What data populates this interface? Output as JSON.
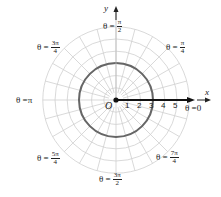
{
  "chart_data": {
    "type": "polar",
    "title": "",
    "axes": {
      "x_label": "x",
      "y_label": "y",
      "origin_label": "O"
    },
    "radial_ticks": [
      "1",
      "2",
      "3",
      "4",
      "5"
    ],
    "radial_max": 6,
    "angular_grid_step_deg": 15,
    "curve": {
      "equation": "r = 3",
      "radius": 3,
      "color": "#666666"
    },
    "ray": {
      "theta": 0,
      "color": "#111111"
    },
    "angle_labels": [
      {
        "id": "theta-0",
        "prefix": "θ = ",
        "value": "0"
      },
      {
        "id": "theta-pi-over-4",
        "prefix": "θ = ",
        "num": "π",
        "den": "4"
      },
      {
        "id": "theta-pi-over-2",
        "prefix": "θ = ",
        "num": "π",
        "den": "2"
      },
      {
        "id": "theta-3pi-over-4",
        "prefix": "θ = ",
        "num": "3π",
        "den": "4"
      },
      {
        "id": "theta-pi",
        "prefix": "θ = ",
        "value": "π"
      },
      {
        "id": "theta-5pi-over-4",
        "prefix": "θ = ",
        "num": "5π",
        "den": "4"
      },
      {
        "id": "theta-3pi-over-2",
        "prefix": "θ = ",
        "num": "3π",
        "den": "2"
      },
      {
        "id": "theta-7pi-over-4",
        "prefix": "θ = ",
        "num": "7π",
        "den": "4"
      }
    ]
  }
}
